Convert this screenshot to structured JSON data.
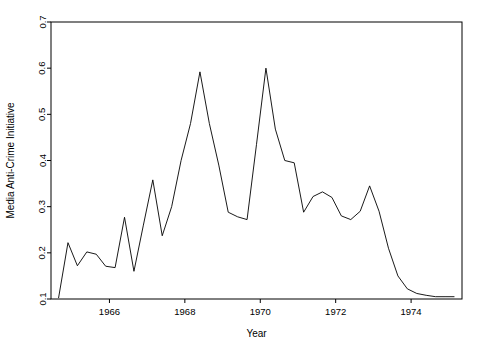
{
  "chart_data": {
    "type": "line",
    "title": "",
    "xlabel": "Year",
    "ylabel": "Media Anti-Crime Initiative",
    "xlim": [
      1964.45,
      1975.35
    ],
    "ylim": [
      0.1,
      0.7
    ],
    "grid": false,
    "legend": null,
    "xticks": [
      1966,
      1968,
      1970,
      1972,
      1974
    ],
    "xticklabels": [
      "1966",
      "1968",
      "1970",
      "1972",
      "1974"
    ],
    "yticks": [
      0.1,
      0.2,
      0.3,
      0.4,
      0.5,
      0.6,
      0.7
    ],
    "yticklabels": [
      "0.1",
      "0.2",
      "0.3",
      "0.4",
      "0.5",
      "0.6",
      "0.7"
    ],
    "line_color": "#000000",
    "x": [
      1964.65,
      1964.9,
      1965.15,
      1965.4,
      1965.65,
      1965.9,
      1966.15,
      1966.4,
      1966.65,
      1966.9,
      1967.15,
      1967.4,
      1967.65,
      1967.9,
      1968.15,
      1968.4,
      1968.65,
      1968.9,
      1969.15,
      1969.4,
      1969.65,
      1969.9,
      1970.15,
      1970.4,
      1970.65,
      1970.9,
      1971.15,
      1971.4,
      1971.65,
      1971.9,
      1972.15,
      1972.4,
      1972.65,
      1972.9,
      1973.15,
      1973.4,
      1973.65,
      1973.9,
      1974.15,
      1974.4,
      1974.65,
      1974.9,
      1975.15
    ],
    "y": [
      0.102,
      0.222,
      0.172,
      0.202,
      0.197,
      0.171,
      0.168,
      0.277,
      0.16,
      0.26,
      0.358,
      0.237,
      0.3,
      0.4,
      0.48,
      0.592,
      0.48,
      0.39,
      0.288,
      0.278,
      0.272,
      0.435,
      0.6,
      0.468,
      0.4,
      0.395,
      0.288,
      0.322,
      0.332,
      0.32,
      0.28,
      0.272,
      0.29,
      0.345,
      0.29,
      0.21,
      0.15,
      0.122,
      0.112,
      0.108,
      0.105,
      0.105,
      0.105
    ]
  },
  "geometry": {
    "plot_left": 51,
    "plot_right": 462,
    "plot_top": 22,
    "plot_bottom": 299
  }
}
